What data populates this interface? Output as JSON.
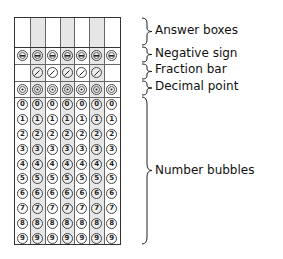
{
  "diagram": {
    "columns": 7,
    "shaded_columns": [
      1,
      3,
      5
    ],
    "rows": {
      "answer_boxes": {
        "label": "Answer boxes"
      },
      "negative_sign": {
        "label": "Negative sign",
        "symbol": "−",
        "columns": [
          0,
          1,
          2,
          3,
          4,
          5,
          6
        ]
      },
      "fraction_bar": {
        "label": "Fraction bar",
        "symbol": "/",
        "columns": [
          1,
          2,
          3,
          4,
          5
        ]
      },
      "decimal_point": {
        "label": "Decimal point",
        "symbol": "·",
        "columns": [
          0,
          1,
          2,
          3,
          4,
          5,
          6
        ]
      },
      "number_bubbles": {
        "label": "Number bubbles",
        "digits": [
          "0",
          "1",
          "2",
          "3",
          "4",
          "5",
          "6",
          "7",
          "8",
          "9"
        ]
      }
    },
    "colors": {
      "shade": "#e6e6e6",
      "border": "#333333",
      "text": "#111111"
    }
  }
}
